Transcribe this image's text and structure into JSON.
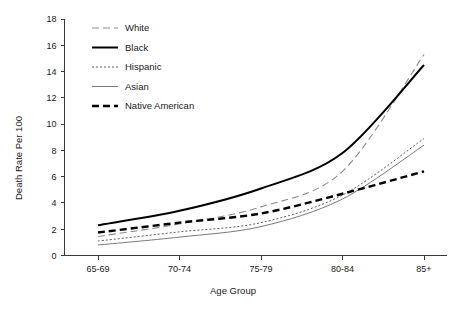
{
  "chart_data": {
    "type": "line",
    "title": "",
    "xlabel": "Age Group",
    "ylabel": "Death Rate Per 100",
    "categories": [
      "65-69",
      "70-74",
      "75-79",
      "80-84",
      "85+"
    ],
    "ylim": [
      0,
      18
    ],
    "yticks": [
      0,
      2,
      4,
      6,
      8,
      10,
      12,
      14,
      16,
      18
    ],
    "ytick_labels": [
      "0",
      "2",
      "4",
      "6",
      "8",
      "10",
      "12",
      "14",
      "16",
      "18"
    ],
    "grid": false,
    "legend_position": "top-left-inside",
    "series": [
      {
        "name": "White",
        "values": [
          1.45,
          2.4,
          3.7,
          6.4,
          15.3
        ],
        "color": "#8c8c8c",
        "style": "long-dash",
        "dasharray": "7,4",
        "width": 1.1
      },
      {
        "name": "Black",
        "values": [
          2.3,
          3.4,
          5.1,
          7.8,
          14.5
        ],
        "color": "#000000",
        "style": "solid",
        "dasharray": "none",
        "width": 2.0
      },
      {
        "name": "Hispanic",
        "values": [
          1.1,
          1.8,
          2.5,
          4.6,
          8.9
        ],
        "color": "#4d4d4d",
        "style": "fine-dotted",
        "dasharray": "2,2",
        "width": 0.9
      },
      {
        "name": "Asian",
        "values": [
          0.8,
          1.4,
          2.2,
          4.3,
          8.4
        ],
        "color": "#7a7a7a",
        "style": "thin-solid",
        "dasharray": "none",
        "width": 1.0
      },
      {
        "name": "Native American",
        "values": [
          1.75,
          2.5,
          3.2,
          4.7,
          6.4
        ],
        "color": "#000000",
        "style": "bold-dash",
        "dasharray": "7,4",
        "width": 2.4
      }
    ]
  },
  "legend": {
    "entries": [
      {
        "label": "White"
      },
      {
        "label": "Black"
      },
      {
        "label": "Hispanic"
      },
      {
        "label": "Asian"
      },
      {
        "label": "Native American"
      }
    ]
  }
}
